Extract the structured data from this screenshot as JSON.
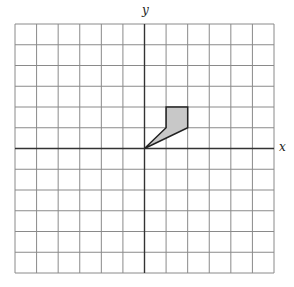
{
  "top_text_fragment": "",
  "axes": {
    "x_label": "x",
    "y_label": "y"
  },
  "grid": {
    "columns": 12,
    "rows": 12,
    "x_range": [
      -6,
      6
    ],
    "y_range": [
      -6,
      6
    ],
    "line_color": "#8a8a8a",
    "axis_color": "#333333"
  },
  "shape": {
    "vertices": [
      [
        0,
        0
      ],
      [
        1,
        1
      ],
      [
        1,
        2
      ],
      [
        2,
        2
      ],
      [
        2,
        1
      ]
    ],
    "fill": "#c8c8c8",
    "stroke": "#222222"
  }
}
